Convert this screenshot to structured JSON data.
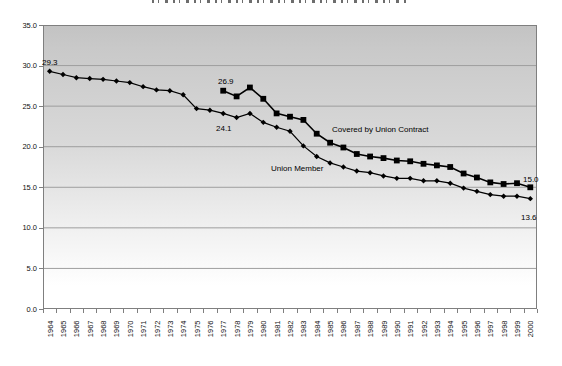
{
  "chart_data": {
    "type": "line",
    "title": "",
    "xlabel": "",
    "ylabel": "",
    "ylim": [
      0,
      35
    ],
    "y_tick_values": [
      35,
      30,
      25,
      20,
      15,
      10,
      5,
      0
    ],
    "y_tick_labels": [
      "35.0",
      "30.0",
      "25.0",
      "20.0",
      "15.0",
      "10.0",
      "5.0",
      "0.0"
    ],
    "grid": "horizontal-major",
    "legend": "none (series labeled by in-plot annotations)",
    "x": [
      1964,
      1965,
      1966,
      1967,
      1968,
      1969,
      1970,
      1971,
      1972,
      1973,
      1974,
      1975,
      1976,
      1977,
      1978,
      1979,
      1980,
      1981,
      1982,
      1983,
      1984,
      1985,
      1986,
      1987,
      1988,
      1989,
      1990,
      1991,
      1992,
      1993,
      1994,
      1995,
      1996,
      1997,
      1998,
      1999,
      2000
    ],
    "series": [
      {
        "name": "Union Member",
        "marker": "diamond",
        "color": "#000000",
        "values": [
          29.3,
          28.9,
          28.5,
          28.4,
          28.3,
          28.1,
          27.9,
          27.4,
          27.0,
          26.9,
          26.4,
          24.7,
          24.5,
          24.1,
          23.6,
          24.1,
          23.0,
          22.4,
          21.9,
          20.1,
          18.8,
          18.0,
          17.5,
          17.0,
          16.8,
          16.4,
          16.1,
          16.1,
          15.8,
          15.8,
          15.5,
          14.9,
          14.5,
          14.1,
          13.9,
          13.9,
          13.6
        ]
      },
      {
        "name": "Covered by Union Contract",
        "marker": "square",
        "color": "#000000",
        "values": [
          null,
          null,
          null,
          null,
          null,
          null,
          null,
          null,
          null,
          null,
          null,
          null,
          null,
          26.9,
          26.2,
          27.3,
          25.9,
          24.1,
          23.7,
          23.3,
          21.6,
          20.5,
          19.9,
          19.1,
          18.8,
          18.6,
          18.3,
          18.2,
          17.9,
          17.7,
          17.5,
          16.7,
          16.2,
          15.6,
          15.4,
          15.5,
          15.0
        ]
      }
    ],
    "annotations": [
      {
        "text": "29.3"
      },
      {
        "text": "26.9"
      },
      {
        "text": "24.1"
      },
      {
        "text": "Union Member"
      },
      {
        "text": "Covered by Union Contract"
      },
      {
        "text": "15.0"
      },
      {
        "text": "13.6"
      }
    ],
    "colors": {
      "plot_bg_top": "#c3c3c3",
      "plot_bg_bottom": "#ffffff",
      "gridline": "#9e9e9e",
      "border": "#7f7f7f",
      "text": "#111111",
      "series": "#000000"
    }
  }
}
